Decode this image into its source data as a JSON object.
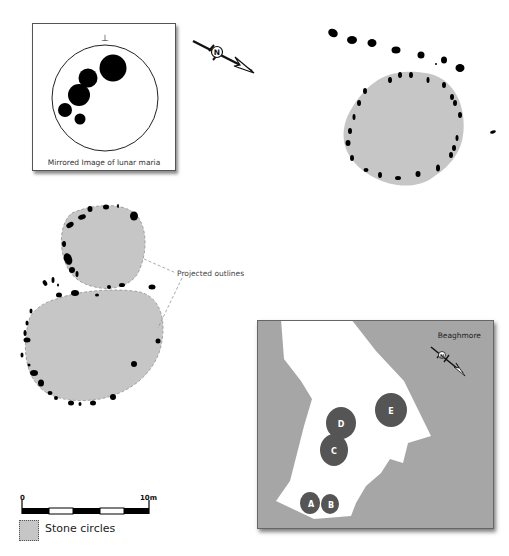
{
  "figure": {
    "site_name": "Beaghmore",
    "legend": {
      "stone_circles_label": "Stone circles"
    },
    "scale_bar": {
      "start_label": "0",
      "end_label": "10m"
    },
    "annotations": {
      "projected_outlines": "Projected outlines"
    },
    "moon_inset": {
      "caption": "Mirrored Image of lunar maria",
      "top_marker": "⊥"
    },
    "north_arrow_label": "N",
    "beaghmore_circles": [
      {
        "label": "A"
      },
      {
        "label": "B"
      },
      {
        "label": "C"
      },
      {
        "label": "D"
      },
      {
        "label": "E"
      }
    ],
    "colors": {
      "circle_fill": "#c6c6c6",
      "stone": "#000000",
      "site_background": "#a6a6a6",
      "site_circle": "#555555",
      "site_circle_label": "#ffffff"
    }
  }
}
